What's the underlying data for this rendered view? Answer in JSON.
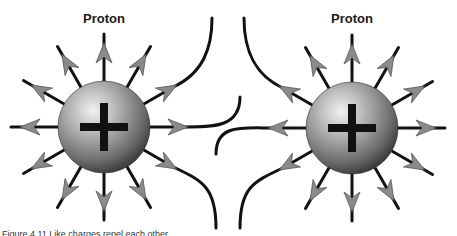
{
  "figure": {
    "background": "#ffffff",
    "line_color": "#111111",
    "arrow_fill": "#8a8a8a",
    "sphere_colors": {
      "highlight": "#e8e8e8",
      "mid": "#a8a8a8",
      "shadow": "#4a4a4a"
    },
    "protons": [
      {
        "label": "Proton",
        "charge_symbol": "+",
        "cx": 104,
        "cy": 127,
        "r": 46,
        "label_x": 104,
        "label_y": 11
      },
      {
        "label": "Proton",
        "charge_symbol": "+",
        "cx": 352,
        "cy": 128,
        "r": 46,
        "label_x": 352,
        "label_y": 11
      }
    ],
    "caption": "Figure 4.11 Like charges repel each other."
  }
}
